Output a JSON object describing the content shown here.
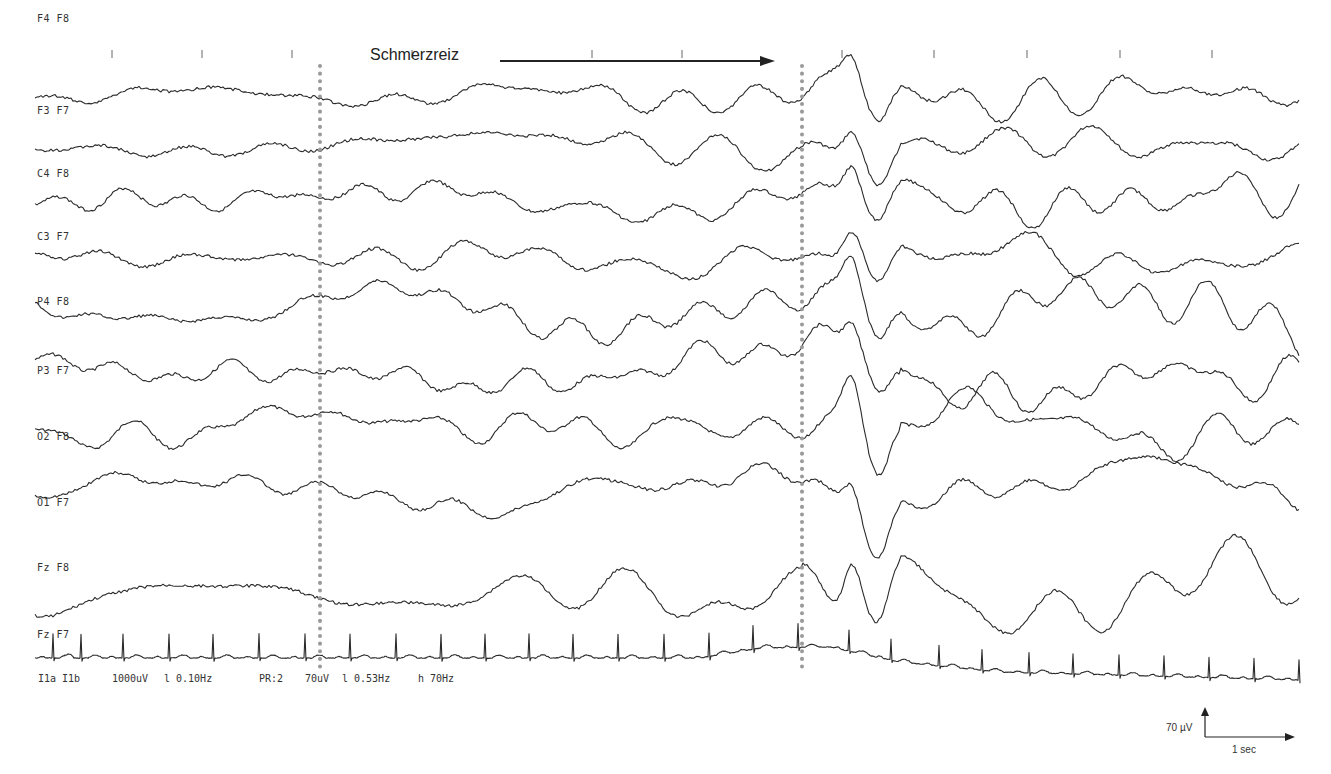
{
  "chart_data": {
    "type": "line",
    "title": "",
    "annotation": {
      "label": "Schmerzreiz",
      "arrow_x_start": 500,
      "arrow_x_end": 775,
      "y": 60
    },
    "markers": [
      {
        "name": "stimulus-start",
        "x": 320
      },
      {
        "name": "stimulus-end",
        "x": 802
      }
    ],
    "time_ticks_x": [
      112,
      202,
      292,
      412,
      592,
      682,
      842,
      934,
      1027,
      1120,
      1212
    ],
    "x_range": [
      35,
      1300
    ],
    "channels": [
      {
        "label": "F4  F8",
        "label_x": 37,
        "label_y": 22,
        "baseline": 95,
        "amp_pre": 7,
        "amp_post": 15,
        "seed": 1
      },
      {
        "label": "F3  F7",
        "label_x": 37,
        "label_y": 114,
        "baseline": 145,
        "amp_pre": 7,
        "amp_post": 16,
        "seed": 2
      },
      {
        "label": "C4  F8",
        "label_x": 37,
        "label_y": 177,
        "baseline": 200,
        "amp_pre": 9,
        "amp_post": 17,
        "seed": 3
      },
      {
        "label": "C3  F7",
        "label_x": 37,
        "label_y": 240,
        "baseline": 258,
        "amp_pre": 9,
        "amp_post": 18,
        "seed": 4
      },
      {
        "label": "P4  F8",
        "label_x": 37,
        "label_y": 305,
        "baseline": 310,
        "amp_pre": 14,
        "amp_post": 20,
        "seed": 5
      },
      {
        "label": "P3  F7",
        "label_x": 37,
        "label_y": 374,
        "baseline": 372,
        "amp_pre": 12,
        "amp_post": 20,
        "seed": 6
      },
      {
        "label": "O2  F8",
        "label_x": 37,
        "label_y": 440,
        "baseline": 425,
        "amp_pre": 15,
        "amp_post": 22,
        "seed": 7
      },
      {
        "label": "O1  F7",
        "label_x": 37,
        "label_y": 506,
        "baseline": 490,
        "amp_pre": 13,
        "amp_post": 22,
        "seed": 8
      },
      {
        "label": "Fz  F8",
        "label_x": 37,
        "label_y": 571,
        "baseline": 595,
        "amp_pre": 10,
        "amp_post": 24,
        "seed": 9
      },
      {
        "label": "Fz  F7",
        "label_x": 37,
        "label_y": 638,
        "baseline": 655,
        "amp_pre": 0,
        "amp_post": 0,
        "seed": 10,
        "type": "ecg"
      }
    ],
    "ecg": {
      "beat_x": [
        52,
        80,
        122,
        168,
        212,
        258,
        304,
        349,
        395,
        440,
        484,
        528,
        572,
        617,
        663,
        708,
        752,
        797,
        848,
        890,
        938,
        981,
        1028,
        1072,
        1118,
        1163,
        1208,
        1253,
        1298
      ],
      "spike_height": 24,
      "drift": [
        [
          35,
          658
        ],
        [
          700,
          658
        ],
        [
          760,
          648
        ],
        [
          830,
          647
        ],
        [
          900,
          662
        ],
        [
          1000,
          672
        ],
        [
          1300,
          680
        ]
      ]
    },
    "settings": {
      "ecg_channel": "IIa IIb",
      "ecg_sensitivity": "1000uV",
      "ecg_low_filter": "l 0.10Hz",
      "program": "PR:2",
      "eeg_sensitivity": "70uV",
      "eeg_low_filter": "l 0.53Hz",
      "eeg_high_filter": "h 70Hz"
    },
    "scale_bar": {
      "amplitude_label": "70 µV",
      "time_label": "1 sec"
    }
  },
  "footer": {
    "ecg_channel": "I1a I1b",
    "ecg_sensitivity": "1000uV",
    "ecg_low_filter": "l 0.10Hz",
    "program": "PR:2",
    "eeg_sensitivity": "70uV",
    "eeg_low_filter": "l 0.53Hz",
    "eeg_high_filter": "h 70Hz"
  },
  "annotation": {
    "label": "Schmerzreiz"
  },
  "scale_bar": {
    "amplitude_label": "70 µV",
    "time_label": "1 sec"
  },
  "colors": {
    "trace": "#2a2a2a",
    "marker": "#9a9a9a",
    "background": "#ffffff"
  }
}
